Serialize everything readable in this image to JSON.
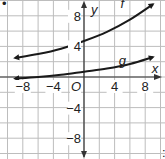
{
  "chart_data": {
    "type": "line",
    "title": "",
    "xlabel": "x",
    "ylabel": "y",
    "origin_label": "O",
    "xlim": [
      -10,
      10
    ],
    "ylim": [
      -10,
      10
    ],
    "grid": true,
    "grid_step": 2,
    "x_tick_labels": [
      "-8",
      "-4",
      "4",
      "8"
    ],
    "x_ticks": [
      -8,
      -4,
      4,
      8
    ],
    "y_tick_labels": [
      "8",
      "4",
      "-4",
      "-8"
    ],
    "y_ticks": [
      8,
      4,
      -4,
      -8
    ],
    "series": [
      {
        "name": "f",
        "label_pos": [
          5,
          9
        ],
        "x": [
          -9,
          -6,
          -3,
          0,
          3,
          6,
          9
        ],
        "y": [
          2.5,
          3.0,
          3.7,
          4.7,
          5.9,
          7.5,
          9.5
        ]
      },
      {
        "name": "g",
        "label_pos": [
          5,
          1.6
        ],
        "x": [
          -9,
          -6,
          -3,
          0,
          3,
          6,
          9
        ],
        "y": [
          -0.2,
          0.0,
          0.3,
          0.7,
          1.1,
          1.7,
          2.6
        ]
      }
    ]
  },
  "labels": {
    "x_axis": "x",
    "y_axis": "y",
    "origin": "O",
    "f": "f",
    "g": "g",
    "extra_mark": ":"
  }
}
